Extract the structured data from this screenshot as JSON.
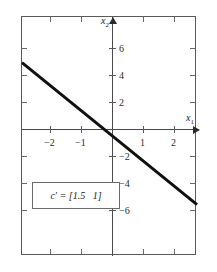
{
  "figure": {
    "background_color": "#ffffff",
    "frame_color": "#5a5a5a",
    "axis_color": "#4a4a4a",
    "line_color": "#101010"
  },
  "axes": {
    "x_name": "x",
    "x_subscript": "1",
    "y_name": "x",
    "y_subscript": "2"
  },
  "chart_data": {
    "type": "line",
    "title": "",
    "xlabel": "x1",
    "ylabel": "x2",
    "xlim": [
      -2.9,
      2.8
    ],
    "ylim": [
      -7.3,
      7.1
    ],
    "grid": false,
    "legend": null,
    "xticks": [
      -2,
      -1,
      1,
      2
    ],
    "xtick_labels": [
      "−2",
      "−1",
      "1",
      "2"
    ],
    "yticks": [
      6,
      4,
      2,
      -2,
      -4,
      -6
    ],
    "ytick_labels": [
      "6",
      "4",
      "2",
      "−2",
      "−4",
      "−6"
    ],
    "series": [
      {
        "name": "objective contour c'x = 0",
        "slope": -1.5,
        "intercept": 0,
        "x": [
          -2.9,
          2.8
        ],
        "values": [
          4.35,
          -4.2
        ],
        "linewidth": 3,
        "color": "#101010"
      }
    ],
    "annotations": [
      {
        "name": "cost-vector-annotation",
        "text": "c′ = [1.5   1]",
        "boxed": true,
        "x": -2.1,
        "y": -3.9
      }
    ]
  },
  "annotation": {
    "formula": "c′ = [1.5   1]"
  },
  "ticks": {
    "x": [
      {
        "label": "−2",
        "value": -2
      },
      {
        "label": "−1",
        "value": -1
      },
      {
        "label": "1",
        "value": 1
      },
      {
        "label": "2",
        "value": 2
      }
    ],
    "y": [
      {
        "label": "6",
        "value": 6
      },
      {
        "label": "4",
        "value": 4
      },
      {
        "label": "2",
        "value": 2
      },
      {
        "label": "−2",
        "value": -2
      },
      {
        "label": "−4",
        "value": -4
      },
      {
        "label": "−6",
        "value": -6
      }
    ]
  }
}
